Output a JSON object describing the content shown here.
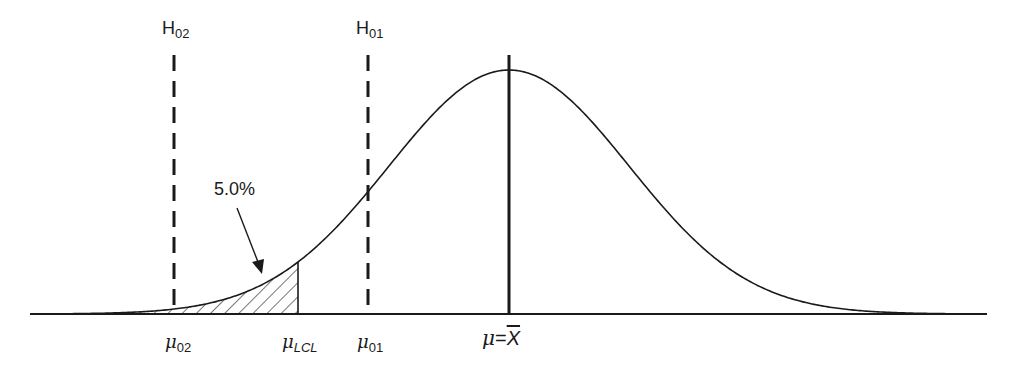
{
  "diagram": {
    "type": "normal-distribution-hypothesis-test",
    "hypothesis_labels": [
      {
        "id": "H02",
        "base": "H",
        "sub": "02"
      },
      {
        "id": "H01",
        "base": "H",
        "sub": "01"
      }
    ],
    "axis_labels": [
      {
        "id": "mu02",
        "symbol": "μ",
        "sub": "02"
      },
      {
        "id": "muLCL",
        "symbol": "μ",
        "sub": "LCL"
      },
      {
        "id": "mu01",
        "symbol": "μ",
        "sub": "01"
      },
      {
        "id": "mu-xbar",
        "symbol": "μ",
        "eq": "=",
        "rhs": "X"
      }
    ],
    "shaded_area_label": "5.0%",
    "colors": {
      "line": "#1a1a1a",
      "background": "#ffffff"
    }
  }
}
